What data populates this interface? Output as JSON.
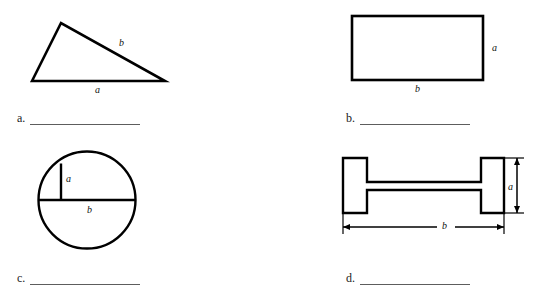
{
  "worksheet": {
    "background_color": "#ffffff",
    "stroke_color": "#000000",
    "line_color": "#5d5d5d",
    "problems": [
      {
        "id": "a",
        "letter": "a.",
        "shape": "triangle",
        "labels": [
          {
            "text": "b",
            "role": "hypotenuse-label"
          },
          {
            "text": "a",
            "role": "base-label"
          }
        ]
      },
      {
        "id": "b",
        "letter": "b.",
        "shape": "rectangle",
        "labels": [
          {
            "text": "a",
            "role": "height-label"
          },
          {
            "text": "b",
            "role": "width-label"
          }
        ]
      },
      {
        "id": "c",
        "letter": "c.",
        "shape": "circle",
        "labels": [
          {
            "text": "a",
            "role": "radius-label"
          },
          {
            "text": "b",
            "role": "diameter-label"
          }
        ]
      },
      {
        "id": "d",
        "letter": "d.",
        "shape": "i-beam",
        "labels": [
          {
            "text": "a",
            "role": "height-dimension-label"
          },
          {
            "text": "b",
            "role": "width-dimension-label"
          }
        ]
      }
    ],
    "answer_lines": [
      {
        "letter": "a.",
        "value": ""
      },
      {
        "letter": "b.",
        "value": ""
      },
      {
        "letter": "c.",
        "value": ""
      },
      {
        "letter": "d.",
        "value": ""
      }
    ]
  }
}
